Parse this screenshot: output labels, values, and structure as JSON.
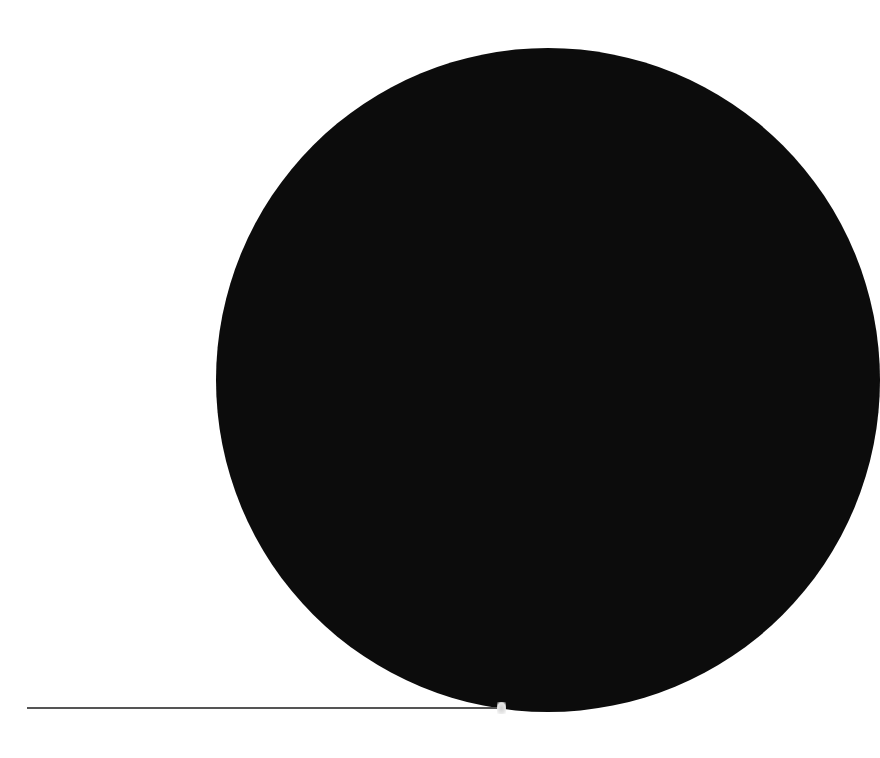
{
  "scene": {
    "description": "Large black circle partially cropped on the right side of a white page, with a thin horizontal rule near the bottom",
    "colors": {
      "background": "#ffffff",
      "disc": "#0c0c0c",
      "rule": "#555555"
    }
  }
}
